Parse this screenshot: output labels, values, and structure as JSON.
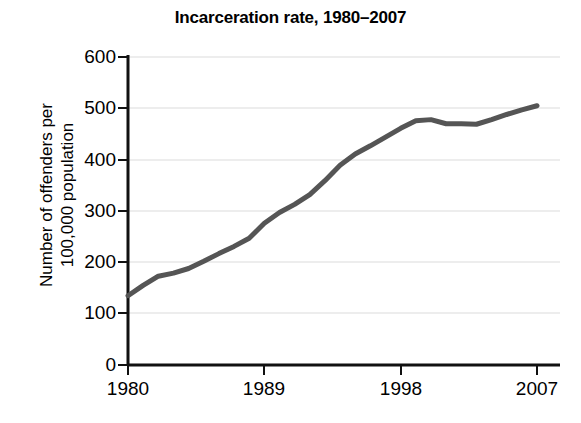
{
  "chart_data": {
    "type": "line",
    "title": "Incarceration rate, 1980–2007",
    "xlabel": "",
    "ylabel": "Number of offenders per\n100,000 population",
    "xlim": [
      1980,
      2007
    ],
    "ylim": [
      0,
      600
    ],
    "ytick_labels": [
      "0",
      "100",
      "200",
      "300",
      "400",
      "500",
      "600"
    ],
    "yticks": [
      0,
      100,
      200,
      300,
      400,
      500,
      600
    ],
    "xtick_labels": [
      "1980",
      "1989",
      "1998",
      "2007"
    ],
    "xticks": [
      1980,
      1989,
      1998,
      2007
    ],
    "grid": "horizontal",
    "grid_color": "#ededed",
    "legend": "none",
    "line_color": "#555555",
    "line_width": 5,
    "series": [
      {
        "name": "Incarceration rate",
        "x": [
          1980,
          1981,
          1982,
          1983,
          1984,
          1985,
          1986,
          1987,
          1988,
          1989,
          1990,
          1991,
          1992,
          1993,
          1994,
          1995,
          1996,
          1997,
          1998,
          1999,
          2000,
          2001,
          2002,
          2003,
          2004,
          2005,
          2006,
          2007
        ],
        "values": [
          135,
          155,
          173,
          179,
          188,
          202,
          217,
          231,
          247,
          276,
          297,
          313,
          332,
          359,
          389,
          411,
          427,
          444,
          461,
          476,
          478,
          470,
          470,
          469,
          478,
          488,
          497,
          505
        ]
      }
    ]
  },
  "axes": {
    "y_axis_name": "y-axis",
    "x_axis_name": "x-axis"
  }
}
